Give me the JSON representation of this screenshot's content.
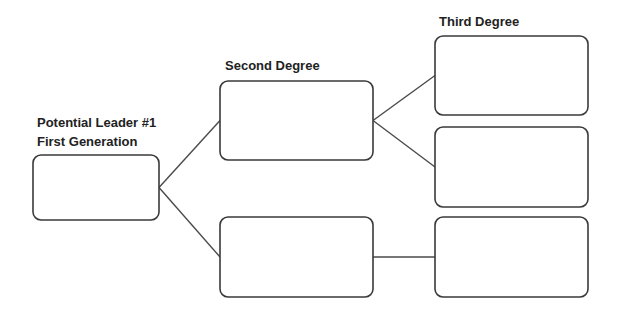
{
  "labels": {
    "first_line1": "Potential Leader #1",
    "first_line2": "First Generation",
    "second": "Second Degree",
    "third": "Third Degree"
  },
  "nodes": [
    {
      "id": "first",
      "level": "First Generation",
      "text": ""
    },
    {
      "id": "second-1",
      "level": "Second Degree",
      "text": ""
    },
    {
      "id": "second-2",
      "level": "Second Degree",
      "text": ""
    },
    {
      "id": "third-1",
      "level": "Third Degree",
      "text": ""
    },
    {
      "id": "third-2",
      "level": "Third Degree",
      "text": ""
    },
    {
      "id": "third-3",
      "level": "Third Degree",
      "text": ""
    }
  ],
  "edges": [
    [
      "first",
      "second-1"
    ],
    [
      "first",
      "second-2"
    ],
    [
      "second-1",
      "third-1"
    ],
    [
      "second-1",
      "third-2"
    ],
    [
      "second-2",
      "third-3"
    ]
  ],
  "colors": {
    "stroke": "#3a3a3a",
    "text": "#222222"
  }
}
